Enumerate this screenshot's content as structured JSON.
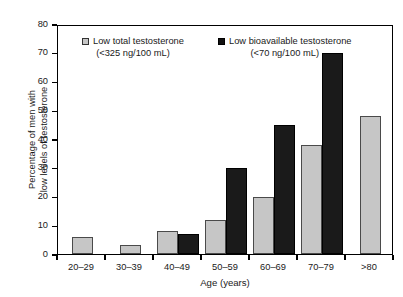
{
  "chart_data": {
    "type": "bar",
    "title": "",
    "xlabel": "Age (years)",
    "ylabel": "Percentage of men with low levels of testosterone",
    "ylabel_lines": [
      "Percentage of men with",
      "low levels of testosterone"
    ],
    "categories": [
      "20–29",
      "30–39",
      "40–49",
      "50–59",
      "60–69",
      "70–79",
      ">80"
    ],
    "series": [
      {
        "name": "Low total testosterone",
        "sublabel": "(<325 ng/100 mL)",
        "color": "#c6c6c6",
        "values": [
          6,
          3,
          8,
          12,
          20,
          38,
          48
        ]
      },
      {
        "name": "Low bioavailable testosterone",
        "sublabel": "(<70 ng/100 mL)",
        "color": "#1a1a1a",
        "values": [
          0,
          0,
          7,
          30,
          45,
          70,
          0
        ]
      }
    ],
    "ylim": [
      0,
      80
    ],
    "yticks": [
      0,
      10,
      20,
      30,
      40,
      50,
      60,
      70,
      80
    ],
    "ytick_labels": [
      "0",
      "10",
      "20",
      "30",
      "40",
      "50",
      "60",
      "70",
      "80"
    ],
    "grid": false,
    "legend_position": "inside-top"
  }
}
